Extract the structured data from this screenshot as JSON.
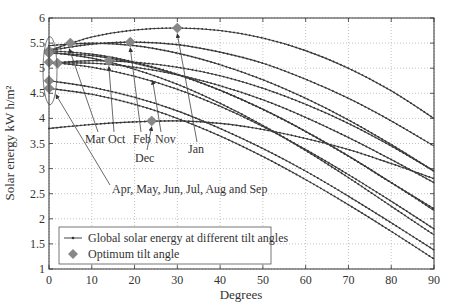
{
  "chart_data": {
    "type": "line",
    "title": "",
    "xlabel": "Degrees",
    "ylabel": "Solar energy kW h/m²",
    "xlim": [
      0,
      90
    ],
    "ylim": [
      1,
      6
    ],
    "x_ticks": [
      "0",
      "10",
      "20",
      "30",
      "40",
      "50",
      "60",
      "70",
      "80",
      "90"
    ],
    "y_ticks": [
      "1",
      "1.5",
      "2",
      "2.5",
      "3",
      "3.5",
      "4",
      "4.5",
      "5",
      "5.5",
      "6"
    ],
    "grid": true,
    "legend": {
      "position": "lower left",
      "entries": [
        "Global solar energy at different tilt angles",
        "Optimum tilt angle"
      ]
    },
    "x": [
      0,
      10,
      20,
      30,
      40,
      50,
      60,
      70,
      80,
      90
    ],
    "series": [
      {
        "name": "Jan",
        "values": [
          5.35,
          5.62,
          5.76,
          5.8,
          5.75,
          5.6,
          5.35,
          5.0,
          4.55,
          4.0
        ],
        "optimum": {
          "x": 30,
          "y": 5.8
        }
      },
      {
        "name": "Feb",
        "values": [
          5.35,
          5.48,
          5.52,
          5.47,
          5.32,
          5.1,
          4.78,
          4.4,
          3.95,
          3.45
        ],
        "optimum": {
          "x": 19,
          "y": 5.52
        }
      },
      {
        "name": "Nov",
        "values": [
          5.1,
          5.15,
          5.12,
          5.02,
          4.85,
          4.6,
          4.28,
          3.9,
          3.45,
          2.95
        ],
        "optimum": {
          "x": 14,
          "y": 5.15
        }
      },
      {
        "name": "Dec",
        "values": [
          3.8,
          3.88,
          3.93,
          3.95,
          3.9,
          3.78,
          3.6,
          3.38,
          3.1,
          2.8
        ],
        "optimum": {
          "x": 24,
          "y": 3.95
        }
      },
      {
        "name": "Mar",
        "values": [
          5.45,
          5.5,
          5.45,
          5.3,
          5.07,
          4.77,
          4.4,
          3.97,
          3.48,
          2.95
        ],
        "optimum": {
          "x": 5,
          "y": 5.5
        }
      },
      {
        "name": "Oct",
        "values": [
          5.1,
          5.1,
          5.02,
          4.87,
          4.65,
          4.37,
          4.02,
          3.62,
          3.18,
          2.72
        ],
        "optimum": {
          "x": 2,
          "y": 5.1
        }
      },
      {
        "name": "Apr",
        "values": [
          5.35,
          5.28,
          5.12,
          4.88,
          4.56,
          4.18,
          3.74,
          3.25,
          2.72,
          2.2
        ],
        "optimum": {
          "x": 0,
          "y": 5.35
        }
      },
      {
        "name": "May",
        "values": [
          5.32,
          5.2,
          4.98,
          4.68,
          4.3,
          3.86,
          3.36,
          2.82,
          2.25,
          1.68
        ],
        "optimum": {
          "x": 0,
          "y": 5.32
        }
      },
      {
        "name": "Jun",
        "values": [
          4.75,
          4.62,
          4.42,
          4.15,
          3.8,
          3.4,
          2.95,
          2.45,
          1.92,
          1.38
        ],
        "optimum": {
          "x": 0,
          "y": 4.75
        }
      },
      {
        "name": "Jul",
        "values": [
          4.6,
          4.48,
          4.28,
          4.0,
          3.65,
          3.24,
          2.78,
          2.28,
          1.75,
          1.2
        ],
        "optimum": {
          "x": 0,
          "y": 4.6
        }
      },
      {
        "name": "Aug",
        "values": [
          5.12,
          5.02,
          4.84,
          4.58,
          4.24,
          3.84,
          3.38,
          2.88,
          2.35,
          1.8
        ],
        "optimum": {
          "x": 0,
          "y": 5.12
        }
      },
      {
        "name": "Sep",
        "values": [
          5.3,
          5.25,
          5.1,
          4.87,
          4.56,
          4.18,
          3.74,
          3.25,
          2.72,
          2.17
        ],
        "optimum": {
          "x": 0,
          "y": 5.3
        }
      }
    ],
    "annotations": [
      {
        "text": "Mar Oct",
        "x": 8,
        "y": 3.7
      },
      {
        "text": "Feb",
        "x": 19,
        "y": 3.7
      },
      {
        "text": "Nov",
        "x": 25,
        "y": 3.7
      },
      {
        "text": "Dec",
        "x": 22,
        "y": 3.3
      },
      {
        "text": "Jan",
        "x": 33,
        "y": 3.4
      },
      {
        "text": "Apr, May, Jun, Jul, Aug and Sep",
        "x": 13,
        "y": 2.5
      }
    ]
  }
}
